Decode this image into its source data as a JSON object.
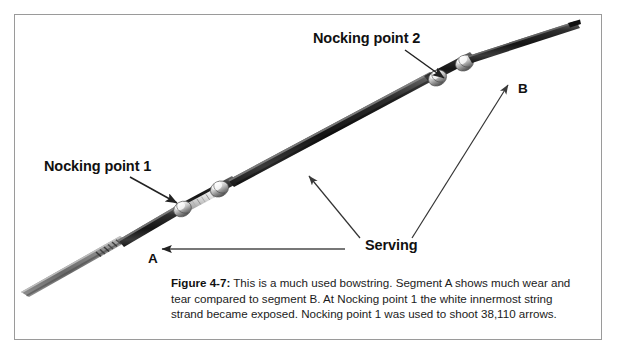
{
  "figure": {
    "background_color": "#ffffff",
    "border_color": "#9a9a9a",
    "caption": {
      "figure_number": "Figure 4-7:",
      "text": " This is a much used bowstring. Segment A shows much wear and tear compared to segment B. At Nocking point 1 the white innermost string strand became exposed. Nocking point 1 was used to shoot 38,110 arrows."
    },
    "labels": {
      "nocking_point_1": "Nocking point 1",
      "nocking_point_2": "Nocking point 2",
      "serving": "Serving",
      "segment_a": "A",
      "segment_b": "B"
    },
    "colors": {
      "string_dark": "#2a2a2a",
      "string_highlight": "#8d8d8d",
      "string_worn": "#8b8b8b",
      "bead_light": "#f2f2f2",
      "bead_mid": "#b9b9b9",
      "bead_dark": "#4a4a4a",
      "leader_line": "#333333",
      "text": "#111111"
    },
    "photo_subject": "used bowstring with two nocking points and serving"
  }
}
